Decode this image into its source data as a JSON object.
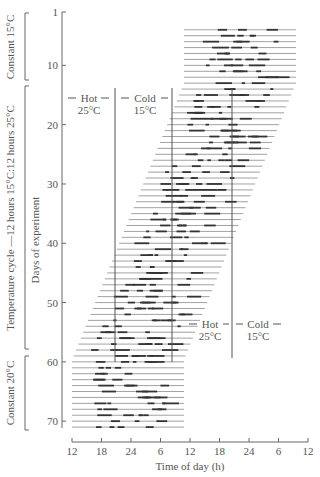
{
  "chart_data": {
    "type": "actogram",
    "title": "",
    "xlabel": "Time of day (h)",
    "ylabel": "Days of experiment",
    "x_ticks": [
      "12",
      "18",
      "24",
      "6",
      "12",
      "18",
      "24",
      "6",
      "12"
    ],
    "y_ticks": [
      "1",
      "10",
      "20",
      "30",
      "40",
      "50",
      "60",
      "70"
    ],
    "ylim": [
      1,
      71
    ],
    "grid": false,
    "conditions": [
      {
        "label": "Constant  15°C",
        "start_day": 1,
        "end_day": 13
      },
      {
        "label": "Temperature cycle —12 hours 15°C:12 hours 25°C",
        "start_day": 14,
        "end_day": 59
      },
      {
        "label": "Constant  20°C",
        "start_day": 60,
        "end_day": 71
      }
    ],
    "phase_labels": [
      {
        "hot": "Hot",
        "hot_temp": "25°C",
        "cold": "Cold",
        "cold_temp": "15°C",
        "position": "top"
      },
      {
        "hot": "Hot",
        "hot_temp": "25°C",
        "cold": "Cold",
        "cold_temp": "15°C",
        "position": "bottom"
      }
    ],
    "record_start_day": 4,
    "record_end_day": 71,
    "free_running_shift_px_per_day": 2.4
  }
}
